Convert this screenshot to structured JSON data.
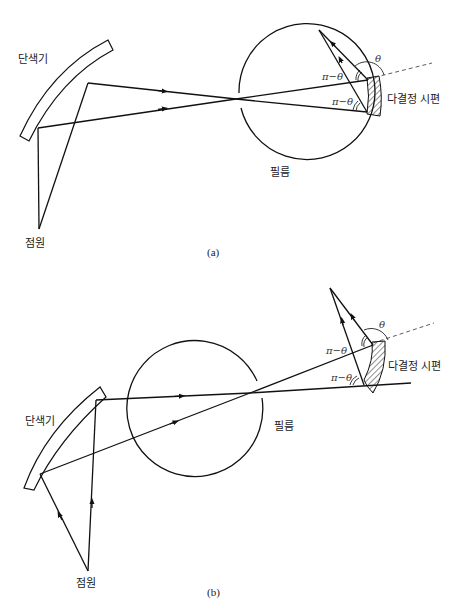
{
  "figure_a": {
    "caption": "(a)",
    "labels": {
      "monochromator": "단색기",
      "point_source": "점원",
      "film": "필름",
      "crystal_sample": "다결정 시편",
      "theta": "θ",
      "pi_minus_theta_upper": "π−θ",
      "pi_minus_theta_lower": "π−θ"
    }
  },
  "figure_b": {
    "caption": "(b)",
    "labels": {
      "monochromator": "단색기",
      "point_source": "점원",
      "film": "필름",
      "crystal_sample": "다결정 시편",
      "theta": "θ",
      "pi_minus_theta_upper": "π−θ",
      "pi_minus_theta_lower": "π−θ"
    }
  }
}
